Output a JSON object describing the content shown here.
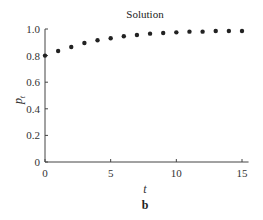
{
  "chart_data": {
    "type": "scatter",
    "title": "Solution",
    "xlabel": "t",
    "ylabel": "p_t",
    "ylabel_main": "p",
    "ylabel_sub": "t",
    "panel_label": "b",
    "xlim": [
      0,
      15.5
    ],
    "ylim": [
      0,
      1.0
    ],
    "xticks": [
      0,
      5,
      10,
      15
    ],
    "xtick_labels": [
      "0",
      "5",
      "10",
      "15"
    ],
    "yticks": [
      0,
      0.2,
      0.4,
      0.6,
      0.8,
      1.0
    ],
    "ytick_labels": [
      "0",
      "0.2",
      "0.4",
      "0.6",
      "0.8",
      "1.0"
    ],
    "grid": false,
    "legend": null,
    "x": [
      0,
      1,
      2,
      3,
      4,
      5,
      6,
      7,
      8,
      9,
      10,
      11,
      12,
      13,
      14,
      15
    ],
    "y": [
      0.8,
      0.835,
      0.865,
      0.895,
      0.915,
      0.93,
      0.945,
      0.955,
      0.965,
      0.97,
      0.975,
      0.98,
      0.98,
      0.985,
      0.985,
      0.985
    ],
    "marker_color": "#222222"
  }
}
